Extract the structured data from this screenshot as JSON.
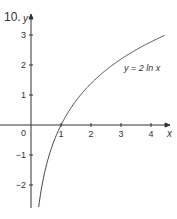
{
  "question_number": "10.",
  "chart_data": {
    "type": "line",
    "title": "",
    "xlabel": "x",
    "ylabel": "y",
    "xlim": [
      -1,
      4.5
    ],
    "ylim": [
      -2.7,
      3.3
    ],
    "x_ticks": [
      1,
      2,
      3,
      4
    ],
    "y_ticks": [
      -2,
      -1,
      1,
      2,
      3
    ],
    "origin_label": "0",
    "grid": false,
    "series": [
      {
        "name": "y = 2 ln x",
        "function": "2*ln(x)",
        "x": [
          0.25,
          0.5,
          1,
          1.5,
          2,
          2.5,
          3,
          3.5,
          4,
          4.47
        ],
        "values": [
          -2.77,
          -1.39,
          0,
          0.81,
          1.39,
          1.83,
          2.2,
          2.51,
          2.77,
          3.0
        ]
      }
    ],
    "annotations": [
      {
        "text": "y = 2 ln x",
        "x": 3.1,
        "y": 1.9
      }
    ]
  }
}
